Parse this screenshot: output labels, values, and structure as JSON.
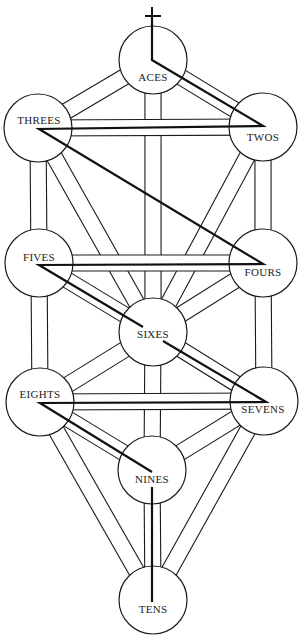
{
  "diagram": {
    "type": "tree-of-life",
    "width": 304,
    "height": 639,
    "node_radius": 34,
    "channel_width": 15,
    "colors": {
      "line": "#1a1a1a",
      "background": "#ffffff",
      "text": "#222222",
      "lightning": "#111111"
    },
    "nodes": [
      {
        "id": "aces",
        "label": "ACES",
        "cx": 153,
        "cy": 60,
        "lx": 153,
        "ly": 81
      },
      {
        "id": "threes",
        "label": "THREES",
        "cx": 38,
        "cy": 128,
        "lx": 39,
        "ly": 124
      },
      {
        "id": "twos",
        "label": "TWOS",
        "cx": 263,
        "cy": 127,
        "lx": 263,
        "ly": 141
      },
      {
        "id": "fives",
        "label": "FIVES",
        "cx": 39,
        "cy": 263,
        "lx": 39,
        "ly": 261
      },
      {
        "id": "fours",
        "label": "FOURS",
        "cx": 263,
        "cy": 263,
        "lx": 263,
        "ly": 276
      },
      {
        "id": "sixes",
        "label": "SIXES",
        "cx": 153,
        "cy": 332,
        "lx": 153,
        "ly": 338
      },
      {
        "id": "eights",
        "label": "EIGHTS",
        "cx": 40,
        "cy": 402,
        "lx": 40,
        "ly": 398
      },
      {
        "id": "sevens",
        "label": "SEVENS",
        "cx": 264,
        "cy": 401,
        "lx": 263,
        "ly": 413
      },
      {
        "id": "nines",
        "label": "NINES",
        "cx": 152,
        "cy": 470,
        "lx": 152,
        "ly": 483
      },
      {
        "id": "tens",
        "label": "TENS",
        "cx": 153,
        "cy": 600,
        "lx": 153,
        "ly": 613
      }
    ],
    "paths": [
      [
        "aces",
        "threes"
      ],
      [
        "aces",
        "twos"
      ],
      [
        "aces",
        "sixes"
      ],
      [
        "threes",
        "fives"
      ],
      [
        "threes",
        "sixes"
      ],
      [
        "twos",
        "fours"
      ],
      [
        "twos",
        "sixes"
      ],
      [
        "fives",
        "sixes"
      ],
      [
        "fours",
        "sixes"
      ],
      [
        "fives",
        "eights"
      ],
      [
        "fours",
        "sevens"
      ],
      [
        "sixes",
        "eights"
      ],
      [
        "sixes",
        "sevens"
      ],
      [
        "sixes",
        "nines"
      ],
      [
        "eights",
        "nines"
      ],
      [
        "sevens",
        "nines"
      ],
      [
        "eights",
        "tens"
      ],
      [
        "sevens",
        "tens"
      ],
      [
        "nines",
        "tens"
      ],
      [
        "threes",
        "twos"
      ],
      [
        "fives",
        "fours"
      ],
      [
        "eights",
        "sevens"
      ]
    ],
    "cross": {
      "vertical": {
        "x": 152,
        "y1": 7,
        "y2": 60
      },
      "bar": {
        "y": 16,
        "x1": 145,
        "x2": 161
      }
    },
    "lightning_segments": [
      [
        [
          152,
          16
        ],
        [
          152,
          60
        ],
        [
          263,
          126
        ],
        [
          39,
          129
        ],
        [
          263,
          264
        ],
        [
          39,
          265
        ],
        [
          143,
          327
        ]
      ],
      [
        [
          163,
          341
        ],
        [
          266,
          402
        ],
        [
          40,
          403
        ],
        [
          152,
          472
        ]
      ],
      [
        [
          152,
          487
        ],
        [
          152,
          602
        ]
      ]
    ]
  }
}
